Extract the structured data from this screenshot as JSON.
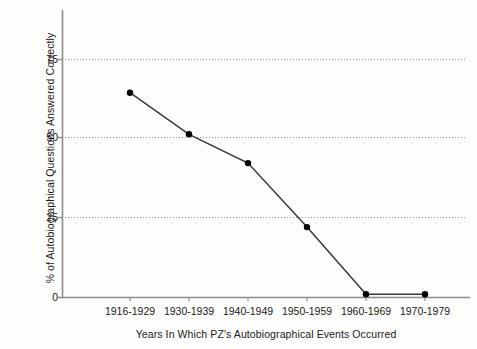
{
  "chart_data": {
    "type": "line",
    "title": "",
    "xlabel": "Years In Which PZ's Autobiographical Events Occurred",
    "ylabel": "% of Autobiographical Questions Answered Correctly",
    "categories": [
      "1916-1929",
      "1930-1939",
      "1940-1949",
      "1950-1959",
      "1960-1969",
      "1970-1979"
    ],
    "values": [
      64,
      51,
      42,
      22,
      1,
      1
    ],
    "yticks": [
      "0",
      "25",
      "50",
      "75"
    ],
    "ytick_values": [
      0,
      25,
      50,
      75
    ],
    "ylim": [
      0,
      90
    ],
    "grid": "horizontal-dotted",
    "legend": "none",
    "marker": "filled-circle",
    "line_color": "#3a3a3a",
    "marker_color": "#000000",
    "grid_color": "#9a9a9a",
    "axis_color": "#8d8d8d",
    "background_color": "#fdfdfb"
  }
}
